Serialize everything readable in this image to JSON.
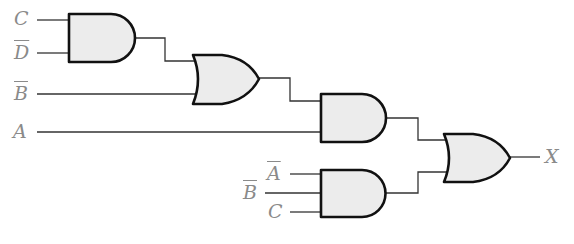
{
  "diagram": {
    "type": "logic-circuit",
    "inputs": [
      {
        "id": "in-C1",
        "label": "C",
        "negated": false
      },
      {
        "id": "in-Dbar",
        "label": "D",
        "negated": true
      },
      {
        "id": "in-Bbar1",
        "label": "B",
        "negated": true
      },
      {
        "id": "in-A",
        "label": "A",
        "negated": false
      },
      {
        "id": "in-Abar",
        "label": "A",
        "negated": true
      },
      {
        "id": "in-Bbar2",
        "label": "B",
        "negated": true
      },
      {
        "id": "in-C2",
        "label": "C",
        "negated": false
      }
    ],
    "gates": [
      {
        "id": "and1",
        "type": "AND",
        "inputs": [
          "C",
          "D̄"
        ]
      },
      {
        "id": "or1",
        "type": "OR",
        "inputs": [
          "and1",
          "B̄"
        ]
      },
      {
        "id": "and2",
        "type": "AND",
        "inputs": [
          "or1",
          "A"
        ]
      },
      {
        "id": "and3",
        "type": "AND",
        "inputs": [
          "Ā",
          "B̄",
          "C"
        ]
      },
      {
        "id": "or2",
        "type": "OR",
        "inputs": [
          "and2",
          "and3"
        ]
      }
    ],
    "output": {
      "label": "X"
    },
    "colors": {
      "gate_fill": "#ececec",
      "gate_stroke": "#111111",
      "wire": "#333333",
      "label": "#8a8a8a"
    }
  }
}
